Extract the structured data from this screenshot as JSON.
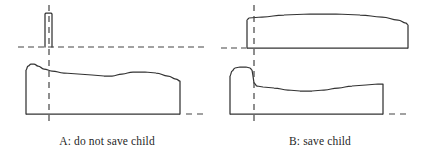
{
  "figure": {
    "width": 427,
    "height": 156,
    "background_color": "#ffffff",
    "stroke_color": "#333333",
    "dash_color": "#444444",
    "caption_color": "#1f1f1f",
    "title": "",
    "panels": [
      {
        "id": "A",
        "caption": "A: do not save child",
        "caption_center_x": 107,
        "caption_y": 141,
        "reference_line": {
          "name": "horizontal-dashed-datum",
          "orientation": "horizontal",
          "y": 47,
          "x_start": 18,
          "x_end": 207,
          "style": "dashed"
        },
        "vertical_marker": {
          "name": "vertical-dashed-marker",
          "orientation": "vertical",
          "x": 49,
          "y_start": 5,
          "y_end": 125,
          "style": "dashed"
        },
        "upper_shape": {
          "name": "narrow-parent-block",
          "description": "narrow tall rectangle resting on the datum line",
          "left": 45,
          "right": 52,
          "top": 13,
          "bottom": 47,
          "outline": [
            [
              45,
              47
            ],
            [
              45,
              14
            ],
            [
              46,
              13
            ],
            [
              51,
              13
            ],
            [
              52,
              14
            ],
            [
              52,
              47
            ]
          ]
        },
        "lower_shape": {
          "name": "wide-undulating-block",
          "description": "wide block with rounded peak at left and gently wavy top edge",
          "baseline_y": 114,
          "left": 26,
          "right": 180,
          "outline": [
            [
              26,
              114
            ],
            [
              26,
              70
            ],
            [
              28,
              66
            ],
            [
              31,
              64
            ],
            [
              34,
              64
            ],
            [
              38,
              66
            ],
            [
              44,
              69
            ],
            [
              52,
              71
            ],
            [
              64,
              73
            ],
            [
              78,
              74
            ],
            [
              92,
              75
            ],
            [
              104,
              76
            ],
            [
              112,
              76
            ],
            [
              122,
              74
            ],
            [
              133,
              72
            ],
            [
              145,
              72
            ],
            [
              156,
              73
            ],
            [
              168,
              76
            ],
            [
              176,
              79
            ],
            [
              180,
              81
            ],
            [
              180,
              114
            ]
          ]
        },
        "baseline": {
          "name": "solid-baseline",
          "y": 114,
          "x_start": 26,
          "x_end": 180,
          "style": "solid"
        },
        "baseline_extension": {
          "name": "baseline-dash-extension",
          "y": 114,
          "x_start": 186,
          "x_end": 207,
          "style": "dashed"
        }
      },
      {
        "id": "B",
        "caption": "B: save child",
        "caption_center_x": 320,
        "caption_y": 141,
        "reference_line": {
          "name": "horizontal-dashed-datum",
          "orientation": "horizontal",
          "y": 48,
          "x_start": 221,
          "x_end": 246,
          "style": "dashed"
        },
        "vertical_marker": {
          "name": "vertical-dashed-marker",
          "orientation": "vertical",
          "x": 254,
          "y_start": 5,
          "y_end": 125,
          "style": "dashed"
        },
        "upper_shape": {
          "name": "wide-arched-parent-block",
          "description": "tall wide block whose top edge arcs gently upward then tapers to the right",
          "baseline_y": 48,
          "left": 247,
          "right": 408,
          "outline": [
            [
              247,
              48
            ],
            [
              247,
              20
            ],
            [
              249,
              18
            ],
            [
              262,
              17
            ],
            [
              284,
              15
            ],
            [
              310,
              14
            ],
            [
              336,
              14
            ],
            [
              360,
              15
            ],
            [
              382,
              17
            ],
            [
              398,
              20
            ],
            [
              406,
              23
            ],
            [
              408,
              25
            ],
            [
              408,
              48
            ]
          ]
        },
        "upper_baseline": {
          "name": "solid-baseline",
          "y": 48,
          "x_start": 247,
          "x_end": 408,
          "style": "solid"
        },
        "lower_shape": {
          "name": "bump-then-valley-block",
          "description": "left bump that drops sharply at the marker into a valley, then rises steadily to the right edge",
          "baseline_y": 114,
          "left": 230,
          "right": 383,
          "outline": [
            [
              230,
              114
            ],
            [
              230,
              76
            ],
            [
              232,
              71
            ],
            [
              235,
              68
            ],
            [
              240,
              67
            ],
            [
              246,
              67
            ],
            [
              250,
              68
            ],
            [
              252,
              70
            ],
            [
              253,
              76
            ],
            [
              254,
              83
            ],
            [
              257,
              86
            ],
            [
              263,
              87
            ],
            [
              274,
              88
            ],
            [
              288,
              90
            ],
            [
              300,
              91
            ],
            [
              312,
              91
            ],
            [
              324,
              90
            ],
            [
              338,
              88
            ],
            [
              352,
              86
            ],
            [
              366,
              85
            ],
            [
              378,
              84
            ],
            [
              383,
              84
            ],
            [
              383,
              114
            ]
          ]
        },
        "baseline": {
          "name": "solid-baseline",
          "y": 114,
          "x_start": 230,
          "x_end": 383,
          "style": "solid"
        },
        "baseline_extension": {
          "name": "baseline-dash-extension",
          "y": 114,
          "x_start": 389,
          "x_end": 410,
          "style": "dashed"
        }
      }
    ]
  }
}
